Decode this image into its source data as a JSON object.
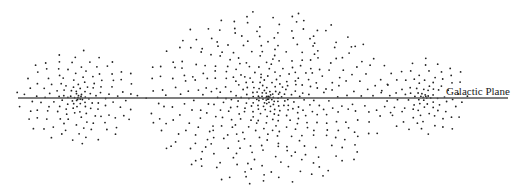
{
  "diagram": {
    "title": "",
    "plane_label": "Galactic Plane",
    "background": "#ffffff",
    "line_color": "#555555",
    "star_color": "#222222",
    "plane": {
      "x1": 18,
      "x2": 508,
      "y": 98
    },
    "clusters": [
      {
        "name": "left-cluster",
        "cx": 78,
        "cy": 98,
        "rx": 62,
        "ry": 48,
        "count": 150,
        "seed": 11
      },
      {
        "name": "central-cluster",
        "cx": 268,
        "cy": 98,
        "rx": 125,
        "ry": 88,
        "count": 460,
        "seed": 23
      },
      {
        "name": "right-cluster",
        "cx": 425,
        "cy": 97,
        "rx": 45,
        "ry": 40,
        "count": 95,
        "seed": 37
      }
    ]
  }
}
